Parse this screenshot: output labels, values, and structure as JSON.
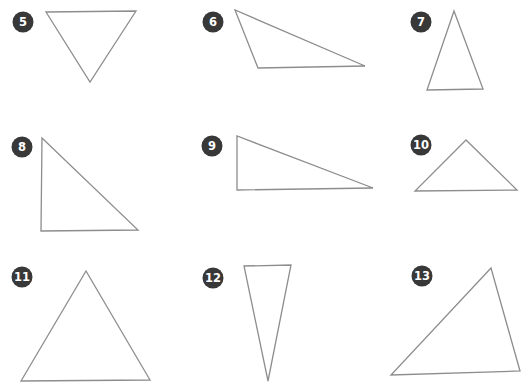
{
  "page": {
    "background": "#ffffff",
    "description_labels": []
  },
  "colors": {
    "triangle_stroke": "#8d8d8d",
    "badge_fill": "#383838",
    "badge_text": "#ffffff"
  },
  "items": [
    {
      "label": "5",
      "shape": "triangle",
      "points": "46,12 136,11 90,82"
    },
    {
      "label": "6",
      "shape": "triangle",
      "points": "235,10 258,68 365,66"
    },
    {
      "label": "7",
      "shape": "triangle",
      "points": "454,11 427,90 483,89"
    },
    {
      "label": "8",
      "shape": "triangle",
      "points": "42,138 41,231 138,230"
    },
    {
      "label": "9",
      "shape": "triangle",
      "points": "237,136 237,190 373,188"
    },
    {
      "label": "10",
      "shape": "triangle",
      "points": "466,140 415,191 517,190"
    },
    {
      "label": "11",
      "shape": "triangle",
      "points": "86,271 21,381 150,380"
    },
    {
      "label": "12",
      "shape": "triangle",
      "points": "244,266 291,265 268,381"
    },
    {
      "label": "13",
      "shape": "triangle",
      "points": "491,268 391,375 520,371"
    }
  ]
}
